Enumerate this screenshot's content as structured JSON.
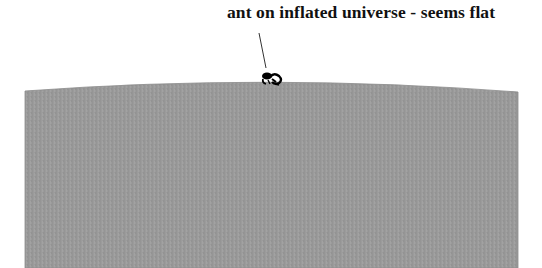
{
  "diagram": {
    "caption": "ant on inflated universe - seems flat",
    "elements": {
      "universe_surface": {
        "description": "large gray surface with slightly curved top edge",
        "fill_color": "#9a9a9a",
        "edge_color": "#7f7f7f"
      },
      "ant": {
        "description": "small black ant silhouette on top of the surface",
        "color": "#000000"
      },
      "pointer_line": {
        "description": "thin line from caption down to the ant",
        "color": "#333333"
      }
    },
    "background_color": "#ffffff"
  }
}
